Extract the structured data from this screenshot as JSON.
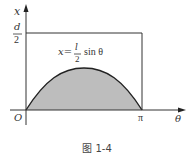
{
  "figure": {
    "caption": "图 1-4",
    "y_axis_label": "x",
    "x_axis_label": "θ",
    "origin_label": "O",
    "pi_label": "π",
    "d_half": {
      "numerator": "d",
      "denominator": "2"
    },
    "equation": {
      "lhs": "x=",
      "numerator": "l",
      "denominator": "2",
      "rhs": "sin θ"
    },
    "colors": {
      "fill": "#bdbdbd",
      "line": "#222222"
    }
  }
}
